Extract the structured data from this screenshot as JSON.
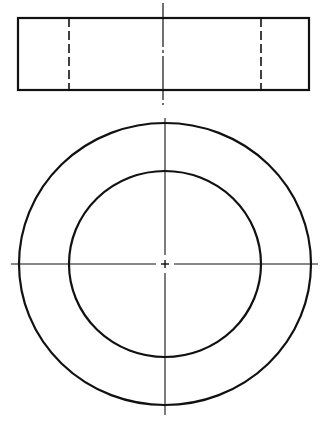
{
  "diagram": {
    "type": "orthographic-projection",
    "colors": {
      "background": "#ffffff",
      "line": "#111111"
    },
    "views": [
      {
        "name": "front-view",
        "outline_rect": {
          "x": 18,
          "y": 18,
          "width": 291,
          "height": 72
        },
        "hidden_lines_x": [
          69,
          261
        ],
        "centerline": {
          "x": 163,
          "y1": 3,
          "y2": 105
        }
      },
      {
        "name": "top-view",
        "center": {
          "x": 165,
          "y": 264
        },
        "outer_circle": {
          "rx": 146,
          "ry": 141
        },
        "inner_circle": {
          "rx": 96,
          "ry": 93
        },
        "horizontal_centerline": {
          "x1": 11,
          "x2": 318,
          "y": 264
        },
        "vertical_centerline": {
          "x": 165,
          "y1": 118,
          "y2": 415
        }
      }
    ]
  }
}
